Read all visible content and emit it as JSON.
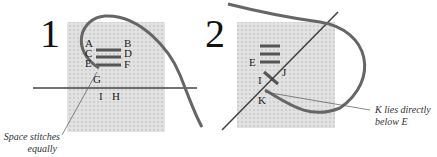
{
  "panels": [
    {
      "step": "1",
      "labels": {
        "A": "A",
        "B": "B",
        "C": "C",
        "D": "D",
        "E": "E",
        "F": "F",
        "G": "G",
        "H": "H",
        "I": "I"
      },
      "caption": [
        "Space stitches",
        "equally"
      ]
    },
    {
      "step": "2",
      "labels": {
        "E": "E",
        "I": "I",
        "J": "J",
        "K": "K"
      },
      "caption": [
        "K lies directly",
        "below E"
      ]
    }
  ],
  "colors": {
    "fabric": "#dcdcdc",
    "thread": "#555555",
    "text": "#222222"
  }
}
